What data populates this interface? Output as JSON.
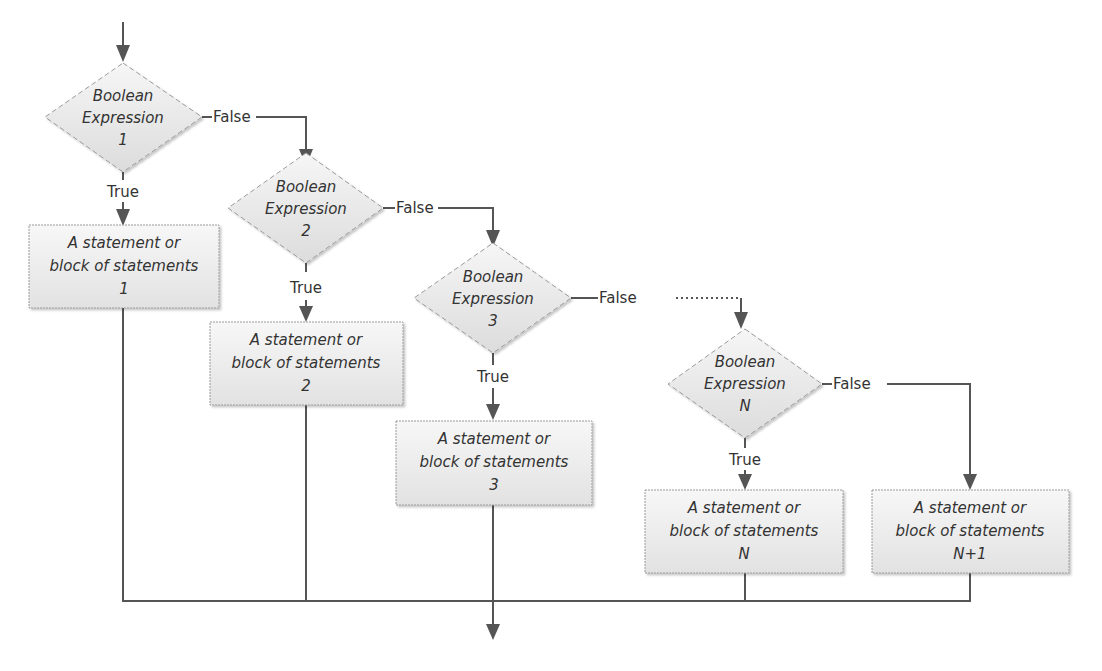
{
  "diagram": {
    "type": "flowchart",
    "decisions": [
      {
        "id": "d1",
        "line1": "Boolean",
        "line2": "Expression",
        "line3": "1",
        "true_label": "True",
        "false_label": "False"
      },
      {
        "id": "d2",
        "line1": "Boolean",
        "line2": "Expression",
        "line3": "2",
        "true_label": "True",
        "false_label": "False"
      },
      {
        "id": "d3",
        "line1": "Boolean",
        "line2": "Expression",
        "line3": "3",
        "true_label": "True",
        "false_label": "False"
      },
      {
        "id": "dN",
        "line1": "Boolean",
        "line2": "Expression",
        "line3": "N",
        "true_label": "True",
        "false_label": "False"
      }
    ],
    "statements": [
      {
        "id": "s1",
        "line1": "A statement or",
        "line2": "block of statements",
        "line3": "1"
      },
      {
        "id": "s2",
        "line1": "A statement or",
        "line2": "block of statements",
        "line3": "2"
      },
      {
        "id": "s3",
        "line1": "A statement or",
        "line2": "block of statements",
        "line3": "3"
      },
      {
        "id": "sN",
        "line1": "A statement or",
        "line2": "block of statements",
        "line3": "N"
      },
      {
        "id": "sN1",
        "line1": "A statement or",
        "line2": "block of statements",
        "line3": "N+1"
      }
    ],
    "edges": [
      {
        "from": "start",
        "to": "d1"
      },
      {
        "from": "d1",
        "to": "s1",
        "label": "True"
      },
      {
        "from": "d1",
        "to": "d2",
        "label": "False"
      },
      {
        "from": "d2",
        "to": "s2",
        "label": "True"
      },
      {
        "from": "d2",
        "to": "d3",
        "label": "False"
      },
      {
        "from": "d3",
        "to": "s3",
        "label": "True"
      },
      {
        "from": "d3",
        "to": "dN",
        "label": "False",
        "style": "dotted-continuation"
      },
      {
        "from": "dN",
        "to": "sN",
        "label": "True"
      },
      {
        "from": "dN",
        "to": "sN1",
        "label": "False"
      },
      {
        "from": "s1",
        "to": "end"
      },
      {
        "from": "s2",
        "to": "end"
      },
      {
        "from": "s3",
        "to": "end"
      },
      {
        "from": "sN",
        "to": "end"
      },
      {
        "from": "sN1",
        "to": "end"
      }
    ],
    "colors": {
      "line": "#555555",
      "text": "#333333",
      "shape_border": "#9a9a9a",
      "shape_fill_light": "#f4f4f4",
      "shape_fill_dark": "#dedede"
    }
  }
}
